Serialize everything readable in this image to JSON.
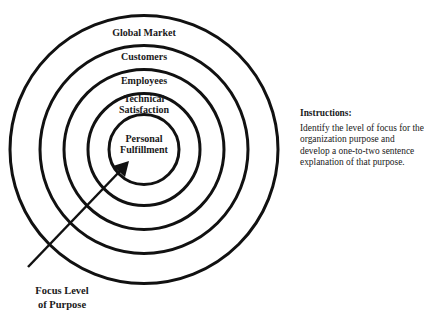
{
  "diagram": {
    "type": "concentric-circles",
    "rings": [
      {
        "label": "Global Market",
        "radius": 134
      },
      {
        "label": "Customers",
        "radius": 104
      },
      {
        "label": "Employees",
        "radius": 80
      },
      {
        "label": "Technical Satisfaction",
        "radius": 56
      },
      {
        "label": "Personal Fulfillment",
        "radius": 35
      }
    ],
    "labels": {
      "global_market": "Global Market",
      "customers": "Customers",
      "employees": "Employees",
      "technical_line1": "Technical",
      "technical_line2": "Satisfaction",
      "personal_line1": "Personal",
      "personal_line2": "Fulfillment"
    },
    "arrow": {
      "label_line1": "Focus Level",
      "label_line2": "of Purpose"
    },
    "colors": {
      "stroke": "#111111",
      "background": "#ffffff"
    }
  },
  "instructions": {
    "title": "Instructions:",
    "body": "Identify the level of focus for the organization purpose and develop a one-to-two sentence explanation of that purpose."
  }
}
